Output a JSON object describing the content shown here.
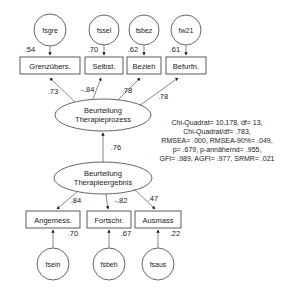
{
  "diagram": {
    "type": "path-diagram",
    "colors": {
      "stroke": "#555555",
      "text": "#1a1a1a",
      "background": "#ffffff"
    },
    "top_residuals": [
      {
        "id": "fsgre",
        "label": "fsgre",
        "cx": 50,
        "cy": 30,
        "r": 16
      },
      {
        "id": "fssel",
        "label": "fssel",
        "cx": 104,
        "cy": 30,
        "r": 15
      },
      {
        "id": "fsbez",
        "label": "fsbez",
        "cx": 144,
        "cy": 30,
        "r": 15
      },
      {
        "id": "fw21",
        "label": "fw21",
        "cx": 186,
        "cy": 30,
        "r": 15
      }
    ],
    "top_indicators": [
      {
        "id": "grenzuebers",
        "label": "Grenzübers.",
        "x": 20,
        "y": 57,
        "w": 60,
        "h": 17,
        "loading": ".54"
      },
      {
        "id": "selbst",
        "label": "Selbst.",
        "x": 85,
        "y": 57,
        "w": 38,
        "h": 17,
        "loading": ".70"
      },
      {
        "id": "bezieh",
        "label": "Bezieh",
        "x": 127,
        "y": 57,
        "w": 34,
        "h": 17,
        "loading": ".62"
      },
      {
        "id": "befurfn",
        "label": "Befurfn.",
        "x": 166,
        "y": 57,
        "w": 40,
        "h": 17,
        "loading": ".61"
      }
    ],
    "latent_process": {
      "id": "beurteilung-therapieprozess",
      "line1": "Beurteilung",
      "line2": "Therapieprozess",
      "cx": 103,
      "cy": 115,
      "rx": 48,
      "ry": 16
    },
    "latent_outcome": {
      "id": "beurteilung-therapieergebnis",
      "line1": "Beurteilung",
      "line2": "Therapieergebnis",
      "cx": 103,
      "cy": 178,
      "rx": 49,
      "ry": 16
    },
    "process_loadings": [
      {
        "from": "beurteilung-therapieprozess",
        "to": "grenzuebers",
        "value": ".73"
      },
      {
        "from": "beurteilung-therapieprozess",
        "to": "selbst",
        "value": "-.84"
      },
      {
        "from": "beurteilung-therapieprozess",
        "to": "bezieh",
        "value": ".78"
      },
      {
        "from": "beurteilung-therapieprozess",
        "to": "befurfn",
        "value": ".78"
      }
    ],
    "structural_path": {
      "from": "beurteilung-therapieergebnis",
      "to": "beurteilung-therapieprozess",
      "value": ".76"
    },
    "outcome_loadings": [
      {
        "from": "beurteilung-therapieergebnis",
        "to": "angemess",
        "value": ".84"
      },
      {
        "from": "beurteilung-therapieergebnis",
        "to": "fortschr",
        "value": "-.82"
      },
      {
        "from": "beurteilung-therapieergebnis",
        "to": "ausmass",
        "value": ".47"
      }
    ],
    "bottom_indicators": [
      {
        "id": "angemess",
        "label": "Angemess.",
        "x": 26,
        "y": 211,
        "w": 54,
        "h": 17,
        "loading": ".70"
      },
      {
        "id": "fortschr",
        "label": "Fortschr.",
        "x": 87,
        "y": 211,
        "w": 44,
        "h": 17,
        "loading": ".67"
      },
      {
        "id": "ausmass",
        "label": "Ausmass",
        "x": 135,
        "y": 211,
        "w": 46,
        "h": 17,
        "loading": ".22"
      }
    ],
    "bottom_residuals": [
      {
        "id": "fsein",
        "label": "fsein",
        "cx": 53,
        "cy": 264,
        "r": 16
      },
      {
        "id": "fsbeh",
        "label": "fsbeh",
        "cx": 109,
        "cy": 264,
        "r": 16
      },
      {
        "id": "fsaus",
        "label": "fsaus",
        "cx": 158,
        "cy": 264,
        "r": 16
      }
    ],
    "fit_statistics": {
      "lines": [
        "Chi-Quadrat= 10.178, df= 13,",
        "Chi-Quadrat/df= .783,",
        "RMSEA= .000, RMSEA-90%= .049,",
        "p= .679, p-annähernd= .955,",
        "GFI= .989, AGFI= .977, SRMR= .021"
      ]
    }
  }
}
